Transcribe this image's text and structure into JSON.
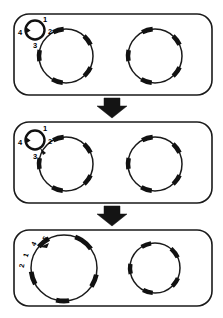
{
  "figure": {
    "panel_count": 3,
    "stroke_color": "#1a1a1a",
    "fill_color": "#ffffff",
    "arrow_color": "#141414"
  },
  "panels": [
    {
      "id": "panel-top",
      "step_label": "1",
      "caption": "",
      "small_circle": {
        "name": "small-vesicle",
        "state": "approaching",
        "labels": [
          "1",
          "2",
          "3",
          "4"
        ],
        "label_positions": [
          "top",
          "right",
          "bottom",
          "left"
        ]
      },
      "large_circle_left": {
        "name": "large-vesicle-left",
        "state": "separate"
      },
      "large_circle_right": {
        "name": "large-vesicle-right",
        "state": "separate"
      }
    },
    {
      "id": "panel-middle",
      "step_label": "2",
      "caption": "",
      "small_circle": {
        "name": "small-vesicle",
        "state": "contacting",
        "labels": [
          "1",
          "2",
          "3",
          "4"
        ],
        "label_positions": [
          "top",
          "right",
          "bottom",
          "left"
        ]
      },
      "large_circle_left": {
        "name": "large-vesicle-left",
        "state": "contacted"
      },
      "large_circle_right": {
        "name": "large-vesicle-right",
        "state": "separate"
      }
    },
    {
      "id": "panel-bottom",
      "step_label": "3",
      "caption": "",
      "small_circle": {
        "name": "small-vesicle",
        "state": "merged",
        "labels": [
          "5",
          "4",
          "1",
          "2"
        ],
        "label_positions": [
          "upper-right",
          "upper",
          "left",
          "lower-left"
        ]
      },
      "large_circle_left": {
        "name": "large-vesicle-left",
        "state": "enlarged"
      },
      "large_circle_right": {
        "name": "large-vesicle-right",
        "state": "separate"
      }
    }
  ],
  "arrows": [
    {
      "name": "transition-arrow-1",
      "direction": "down",
      "label": ""
    },
    {
      "name": "transition-arrow-2",
      "direction": "down",
      "label": ""
    }
  ]
}
